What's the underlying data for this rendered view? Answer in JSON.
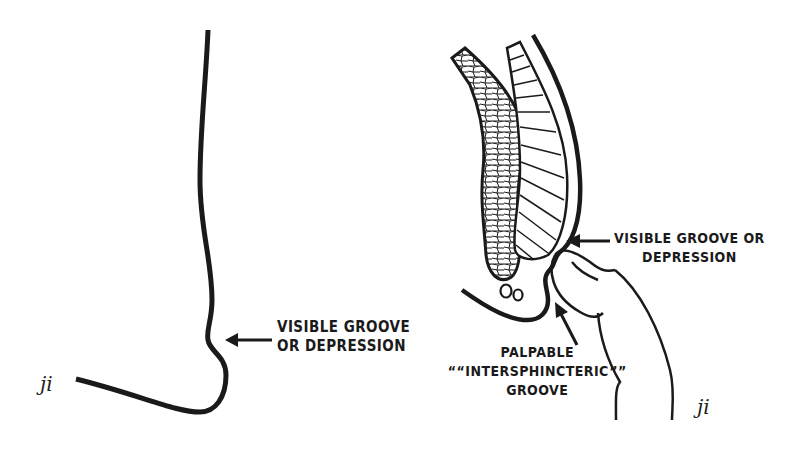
{
  "figure": {
    "left_panel": {
      "label_line1": "VISIBLE GROOVE",
      "label_line2": "OR DEPRESSION",
      "signature": "ji"
    },
    "right_panel": {
      "groove_label_line1": "VISIBLE GROOVE OR",
      "groove_label_line2": "DEPRESSION",
      "palpable_label_line1": "PALPABLE",
      "palpable_label_line2": "““INTERSPHINCTERIC””",
      "palpable_label_line3": "GROOVE",
      "signature": "ji"
    },
    "colors": {
      "ink": "#1a1a1a",
      "background": "#ffffff"
    }
  }
}
